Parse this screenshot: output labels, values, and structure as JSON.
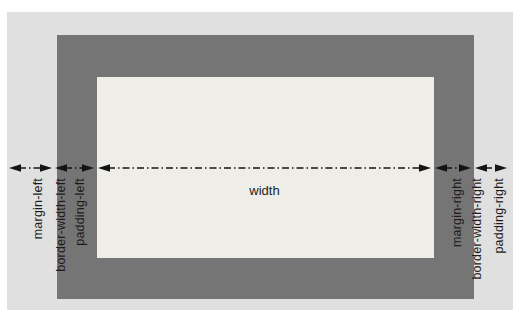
{
  "diagram": {
    "labels": {
      "left": [
        {
          "text": "margin-left"
        },
        {
          "text": "border-width-left"
        },
        {
          "text": "padding-left"
        }
      ],
      "center": {
        "text": "width"
      },
      "right": [
        {
          "text": "margin-right"
        },
        {
          "text": "border-width-right"
        },
        {
          "text": "padding-right"
        }
      ]
    },
    "colors": {
      "page_bg": "#ffffff",
      "margin_area": "#e0e0e0",
      "border_area": "#757575",
      "content_area": "#eeede7",
      "arrow": "#141414",
      "label_text": "#1c1c1c"
    }
  }
}
